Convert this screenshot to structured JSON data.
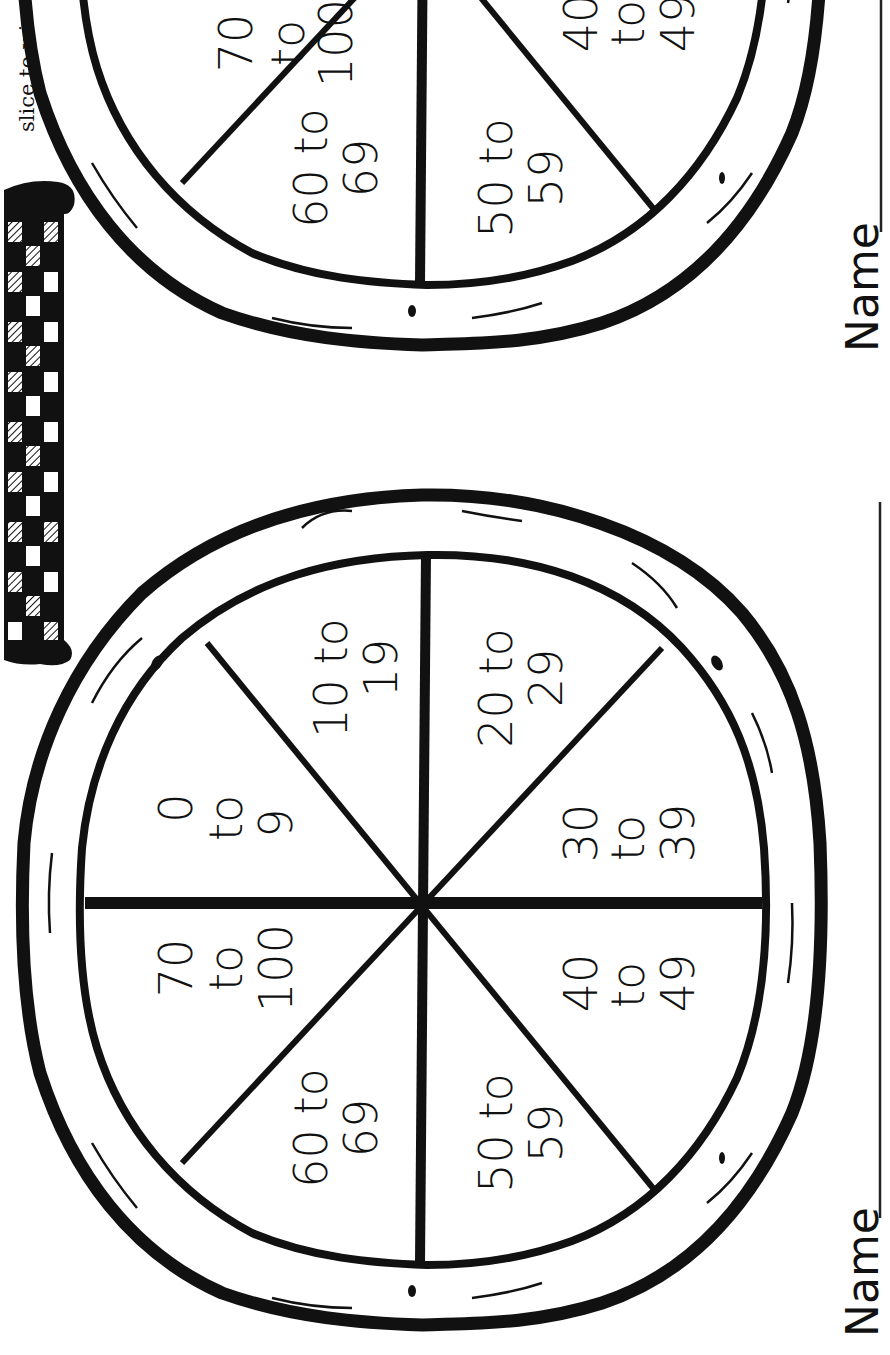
{
  "page": {
    "orientation": "rotated-90-ccw",
    "colors": {
      "ink": "#111111",
      "paper": "#ffffff"
    }
  },
  "instructions": {
    "visible_fragment": "slice to win."
  },
  "name_fields": [
    {
      "label": "Name",
      "value": ""
    },
    {
      "label": "Name",
      "value": ""
    }
  ],
  "decoration": {
    "tablecloth": "checkered-tablecloth"
  },
  "spinners": [
    {
      "id": "top-pizza",
      "partially_visible": true,
      "slices": [
        {
          "line1": "70",
          "line2": "to",
          "line3": "100"
        },
        {
          "line1": "60 to",
          "line2": "69"
        },
        {
          "line1": "50 to",
          "line2": "59"
        },
        {
          "line1": "40",
          "line2": "to",
          "line3": "49"
        }
      ]
    },
    {
      "id": "bottom-pizza",
      "partially_visible": false,
      "slices": [
        {
          "line1": "0",
          "line2": "to",
          "line3": "9"
        },
        {
          "line1": "10 to",
          "line2": "19"
        },
        {
          "line1": "20 to",
          "line2": "29"
        },
        {
          "line1": "30",
          "line2": "to",
          "line3": "39"
        },
        {
          "line1": "40",
          "line2": "to",
          "line3": "49"
        },
        {
          "line1": "50 to",
          "line2": "59"
        },
        {
          "line1": "60 to",
          "line2": "69"
        },
        {
          "line1": "70",
          "line2": "to",
          "line3": "100"
        }
      ]
    }
  ]
}
